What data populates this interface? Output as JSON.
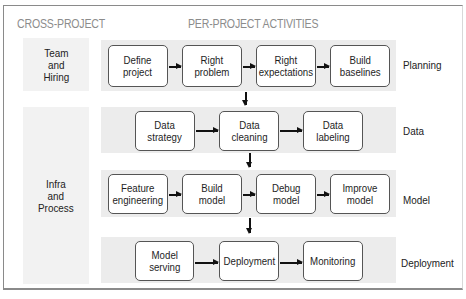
{
  "headers": {
    "cross_project": "CROSS-PROJECT",
    "per_project": "PER-PROJECT ACTIVITIES"
  },
  "cross_project": [
    {
      "label": "Team\nand\nHiring"
    },
    {
      "label": "Infra\nand\nProcess"
    }
  ],
  "rows": [
    {
      "name": "Planning",
      "steps": [
        "Define\nproject",
        "Right\nproblem",
        "Right\nexpectations",
        "Build\nbaselines"
      ]
    },
    {
      "name": "Data",
      "steps": [
        "Data\nstrategy",
        "Data\ncleaning",
        "Data\nlabeling"
      ]
    },
    {
      "name": "Model",
      "steps": [
        "Feature\nengineering",
        "Build\nmodel",
        "Debug\nmodel",
        "Improve\nmodel"
      ]
    },
    {
      "name": "Deployment",
      "steps": [
        "Model\nserving",
        "Deployment",
        "Monitoring"
      ]
    }
  ],
  "colors": {
    "band": "#ececec",
    "cross_band": "#f2f2f2",
    "header_text": "#8c8c8c",
    "box_border": "#555555",
    "arrow": "#111111"
  }
}
